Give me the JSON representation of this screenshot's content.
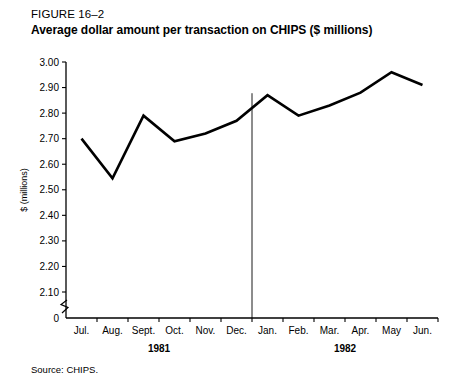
{
  "figure": {
    "label": "FIGURE 16–2",
    "title": "Average dollar amount per transaction on CHIPS ($ millions)",
    "source": "Source: CHIPS."
  },
  "chart_data": {
    "type": "line",
    "title": "Average dollar amount per transaction on CHIPS ($ millions)",
    "xlabel": "",
    "ylabel": "$ (millions)",
    "categories": [
      "Jul.",
      "Aug.",
      "Sept.",
      "Oct.",
      "Nov.",
      "Dec.",
      "Jan.",
      "Feb.",
      "Mar.",
      "Apr.",
      "May",
      "Jun."
    ],
    "values": [
      2.7,
      2.545,
      2.79,
      2.69,
      2.72,
      2.77,
      2.87,
      2.79,
      2.83,
      2.88,
      2.96,
      2.91
    ],
    "ylim": [
      2.1,
      3.0
    ],
    "ytick_labels": [
      "3.00",
      "2.90",
      "2.80",
      "2.70",
      "2.60",
      "2.50",
      "2.40",
      "2.30",
      "2.20",
      "2.10",
      "0"
    ],
    "ytick_values": [
      3.0,
      2.9,
      2.8,
      2.7,
      2.6,
      2.5,
      2.4,
      2.3,
      2.2,
      2.1,
      0
    ],
    "axis_break": true,
    "grid": false,
    "legend": "none",
    "group_labels": [
      {
        "text": "1981",
        "span": [
          "Jul.",
          "Dec."
        ]
      },
      {
        "text": "1982",
        "span": [
          "Jan.",
          "Jun."
        ]
      }
    ],
    "divider_after": "Dec.",
    "line_color": "#000000"
  }
}
